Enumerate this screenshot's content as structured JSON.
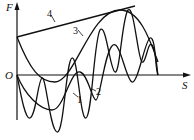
{
  "diagram": {
    "axes": {
      "y_label": "F",
      "x_label": "S",
      "origin_label": "O"
    },
    "curves": [
      {
        "id": "1",
        "label": "1",
        "description": "oscillation with increasing amplitude (higher frequency)"
      },
      {
        "id": "2",
        "label": "2",
        "description": "oscillation with increasing amplitude"
      },
      {
        "id": "3",
        "label": "3",
        "description": "arch-shaped curve rising to a maximum then falling to S axis"
      },
      {
        "id": "4",
        "label": "4",
        "description": "straight line tangent to the peak"
      }
    ],
    "colors": {
      "line": "#111111",
      "background": "#ffffff"
    }
  }
}
